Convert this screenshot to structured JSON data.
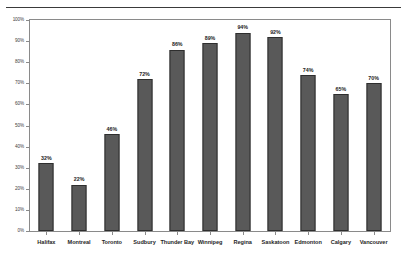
{
  "chart_data": {
    "type": "bar",
    "title": "",
    "subtitle": "",
    "xlabel": "",
    "ylabel": "",
    "ylim": [
      0,
      100
    ],
    "grid": false,
    "legend": null,
    "bar_color": "#595959",
    "bar_border_color": "#2e2e2e",
    "axis_color": "#8a8a8a",
    "background": "#ffffff",
    "categories": [
      "Halifax",
      "Montreal",
      "Toronto",
      "Sudbury",
      "Thunder Bay",
      "Winnipeg",
      "Regina",
      "Saskatoon",
      "Edmonton",
      "Calgary",
      "Vancouver"
    ],
    "values": [
      32,
      22,
      46,
      72,
      86,
      89,
      94,
      92,
      74,
      65,
      70
    ],
    "data_labels": [
      "32%",
      "22%",
      "46%",
      "72%",
      "86%",
      "89%",
      "94%",
      "92%",
      "74%",
      "65%",
      "70%"
    ],
    "ytick_values": [
      0,
      10,
      20,
      30,
      40,
      50,
      60,
      70,
      80,
      90,
      100
    ],
    "ytick_labels": [
      "0%",
      "10%",
      "20%",
      "30%",
      "40%",
      "50%",
      "60%",
      "70%",
      "80%",
      "90%",
      "100%"
    ]
  }
}
